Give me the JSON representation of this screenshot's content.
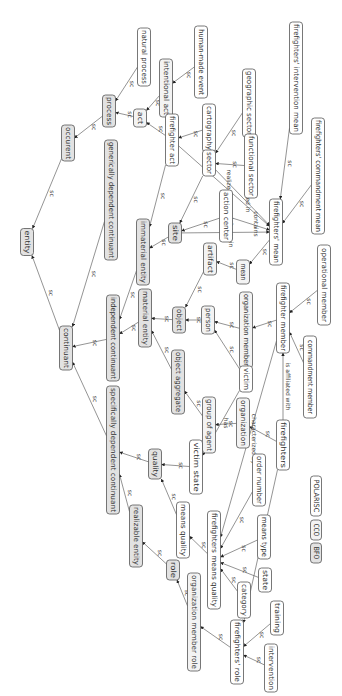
{
  "diagram": {
    "legend": [
      {
        "id": "BFO",
        "label": "BFO",
        "kind": "bfo",
        "cx": 316,
        "cy": 553,
        "w": 11,
        "h": 20
      },
      {
        "id": "CCO",
        "label": "CCO",
        "kind": "cco",
        "cx": 316,
        "cy": 530,
        "w": 11,
        "h": 20
      },
      {
        "id": "POLARISC",
        "label": "POLARISC",
        "kind": "pol",
        "cx": 316,
        "cy": 496,
        "w": 11,
        "h": 40
      }
    ],
    "nodes": [
      {
        "id": "entity",
        "label": "entity",
        "kind": "bfo",
        "cx": 27,
        "cy": 242,
        "w": 13,
        "h": 27
      },
      {
        "id": "occurent",
        "label": "occurent",
        "kind": "bfo",
        "cx": 68,
        "cy": 143,
        "w": 13,
        "h": 36
      },
      {
        "id": "process",
        "label": "process",
        "kind": "bfo",
        "cx": 109,
        "cy": 111,
        "w": 13,
        "h": 32
      },
      {
        "id": "natural_process",
        "label": "natural process",
        "kind": "pol",
        "cx": 144,
        "cy": 57,
        "w": 13,
        "h": 58
      },
      {
        "id": "act",
        "label": "act",
        "kind": "cco",
        "cx": 140,
        "cy": 118,
        "w": 13,
        "h": 18
      },
      {
        "id": "intentional_act",
        "label": "intentional act",
        "kind": "cco",
        "cx": 166,
        "cy": 88,
        "w": 13,
        "h": 58
      },
      {
        "id": "human_made_event",
        "label": "human-made event",
        "kind": "pol",
        "cx": 201,
        "cy": 62,
        "w": 13,
        "h": 72
      },
      {
        "id": "firefighter_act",
        "label": "firefighter act",
        "kind": "pol",
        "cx": 172,
        "cy": 140,
        "w": 13,
        "h": 52
      },
      {
        "id": "cartography",
        "label": "cartography",
        "kind": "pol",
        "cx": 209,
        "cy": 128,
        "w": 13,
        "h": 48
      },
      {
        "id": "geographic_sector",
        "label": "geographic sector",
        "kind": "pol",
        "cx": 249,
        "cy": 103,
        "w": 13,
        "h": 68
      },
      {
        "id": "firefighters_intervention_mean",
        "label": "firefighters' intervention mean",
        "kind": "pol",
        "cx": 296,
        "cy": 78,
        "w": 13,
        "h": 112
      },
      {
        "id": "sector",
        "label": "sector",
        "kind": "pol",
        "cx": 209,
        "cy": 163,
        "w": 13,
        "h": 26
      },
      {
        "id": "functional_sector",
        "label": "functional sector",
        "kind": "pol",
        "cx": 251,
        "cy": 166,
        "w": 13,
        "h": 64
      },
      {
        "id": "firefighters_commandment_mean",
        "label": "firefighters' commandment mean",
        "kind": "pol",
        "cx": 318,
        "cy": 176,
        "w": 13,
        "h": 116
      },
      {
        "id": "generically_dependent_continuant",
        "label": "generically dependent continuant",
        "kind": "bfo",
        "cx": 111,
        "cy": 200,
        "w": 13,
        "h": 120
      },
      {
        "id": "immaterial_entity",
        "label": "immaterial entity",
        "kind": "bfo",
        "cx": 143,
        "cy": 252,
        "w": 13,
        "h": 66
      },
      {
        "id": "site",
        "label": "site",
        "kind": "bfo",
        "cx": 175,
        "cy": 233,
        "w": 13,
        "h": 20
      },
      {
        "id": "action_center",
        "label": "action center",
        "kind": "pol",
        "cx": 226,
        "cy": 216,
        "w": 13,
        "h": 52
      },
      {
        "id": "artifact",
        "label": "artifact",
        "kind": "cco",
        "cx": 210,
        "cy": 259,
        "w": 13,
        "h": 32
      },
      {
        "id": "mean",
        "label": "mean",
        "kind": "cco",
        "cx": 243,
        "cy": 272,
        "w": 13,
        "h": 24
      },
      {
        "id": "firefighters_mean",
        "label": "firefighters' mean",
        "kind": "pol",
        "cx": 276,
        "cy": 232,
        "w": 13,
        "h": 66
      },
      {
        "id": "operational_member",
        "label": "operational member",
        "kind": "pol",
        "cx": 324,
        "cy": 285,
        "w": 13,
        "h": 80
      },
      {
        "id": "continuant",
        "label": "continuant",
        "kind": "bfo",
        "cx": 66,
        "cy": 348,
        "w": 13,
        "h": 44
      },
      {
        "id": "independent_continuant",
        "label": "independent continuant",
        "kind": "bfo",
        "cx": 113,
        "cy": 338,
        "w": 13,
        "h": 86
      },
      {
        "id": "material_entity",
        "label": "material entity",
        "kind": "bfo",
        "cx": 145,
        "cy": 318,
        "w": 13,
        "h": 58
      },
      {
        "id": "object",
        "label": "object",
        "kind": "bfo",
        "cx": 179,
        "cy": 320,
        "w": 13,
        "h": 26
      },
      {
        "id": "person",
        "label": "person",
        "kind": "cco",
        "cx": 208,
        "cy": 320,
        "w": 13,
        "h": 28
      },
      {
        "id": "organization_member",
        "label": "organization member",
        "kind": "cco",
        "cx": 246,
        "cy": 330,
        "w": 13,
        "h": 76
      },
      {
        "id": "firefighter_member",
        "label": "firefighter member",
        "kind": "pol",
        "cx": 283,
        "cy": 318,
        "w": 13,
        "h": 70
      },
      {
        "id": "commandment_member",
        "label": "commandment member",
        "kind": "pol",
        "cx": 310,
        "cy": 377,
        "w": 13,
        "h": 82
      },
      {
        "id": "object_aggregate",
        "label": "object aggregate",
        "kind": "bfo",
        "cx": 178,
        "cy": 382,
        "w": 13,
        "h": 64
      },
      {
        "id": "victim",
        "label": "victim",
        "kind": "pol",
        "cx": 246,
        "cy": 379,
        "w": 13,
        "h": 26
      },
      {
        "id": "group_of_agent",
        "label": "group of agent",
        "kind": "cco",
        "cx": 209,
        "cy": 425,
        "w": 13,
        "h": 56
      },
      {
        "id": "organization",
        "label": "organization",
        "kind": "cco",
        "cx": 243,
        "cy": 423,
        "w": 13,
        "h": 50
      },
      {
        "id": "firefighters",
        "label": "firefighters",
        "kind": "pol",
        "cx": 283,
        "cy": 445,
        "w": 13,
        "h": 50
      },
      {
        "id": "specifically_dependent_continuant",
        "label": "specifically dependent continuant",
        "kind": "bfo",
        "cx": 113,
        "cy": 450,
        "w": 13,
        "h": 128
      },
      {
        "id": "quality",
        "label": "quality",
        "kind": "bfo",
        "cx": 155,
        "cy": 464,
        "w": 13,
        "h": 30
      },
      {
        "id": "victim_state",
        "label": "victim state",
        "kind": "pol",
        "cx": 196,
        "cy": 467,
        "w": 13,
        "h": 54
      },
      {
        "id": "order_number",
        "label": "order number",
        "kind": "pol",
        "cx": 259,
        "cy": 480,
        "w": 13,
        "h": 52
      },
      {
        "id": "realizable_entity",
        "label": "realizable entity",
        "kind": "bfo",
        "cx": 136,
        "cy": 536,
        "w": 13,
        "h": 62
      },
      {
        "id": "means_quality",
        "label": "means quality",
        "kind": "pol",
        "cx": 183,
        "cy": 530,
        "w": 13,
        "h": 56
      },
      {
        "id": "firefighters_means_quality",
        "label": "firefighters means quality",
        "kind": "pol",
        "cx": 214,
        "cy": 560,
        "w": 13,
        "h": 98
      },
      {
        "id": "means_type",
        "label": "means type",
        "kind": "pol",
        "cx": 264,
        "cy": 537,
        "w": 13,
        "h": 44
      },
      {
        "id": "state",
        "label": "state",
        "kind": "pol",
        "cx": 265,
        "cy": 580,
        "w": 13,
        "h": 24
      },
      {
        "id": "category",
        "label": "category",
        "kind": "pol",
        "cx": 244,
        "cy": 600,
        "w": 13,
        "h": 36
      },
      {
        "id": "role",
        "label": "role",
        "kind": "bfo",
        "cx": 173,
        "cy": 570,
        "w": 13,
        "h": 20
      },
      {
        "id": "organization_member_role",
        "label": "organization member role",
        "kind": "cco",
        "cx": 194,
        "cy": 622,
        "w": 13,
        "h": 98
      },
      {
        "id": "firefighters_role",
        "label": "firefighters' role",
        "kind": "pol",
        "cx": 237,
        "cy": 652,
        "w": 13,
        "h": 64
      },
      {
        "id": "training",
        "label": "training",
        "kind": "pol",
        "cx": 277,
        "cy": 618,
        "w": 13,
        "h": 34
      },
      {
        "id": "intervention",
        "label": "intervention",
        "kind": "pol",
        "cx": 271,
        "cy": 668,
        "w": 13,
        "h": 48
      }
    ],
    "edges": [
      {
        "from": "occurent",
        "to": "entity",
        "label": "sc"
      },
      {
        "from": "continuant",
        "to": "entity",
        "label": "sc"
      },
      {
        "from": "process",
        "to": "occurent",
        "label": "sc"
      },
      {
        "from": "natural_process",
        "to": "process",
        "label": "sc"
      },
      {
        "from": "act",
        "to": "process",
        "label": "sc"
      },
      {
        "from": "intentional_act",
        "to": "act",
        "label": "sc"
      },
      {
        "from": "human_made_event",
        "to": "intentional_act",
        "label": "sc"
      },
      {
        "from": "firefighter_act",
        "to": "act",
        "label": "sc"
      },
      {
        "from": "cartography",
        "to": "firefighter_act",
        "label": "sc"
      },
      {
        "from": "geographic_sector",
        "to": "sector",
        "label": "sc"
      },
      {
        "from": "functional_sector",
        "to": "sector",
        "label": "sc"
      },
      {
        "from": "sector",
        "to": "site",
        "label": "sc"
      },
      {
        "from": "action_center",
        "to": "site",
        "label": "sc"
      },
      {
        "from": "site",
        "to": "immaterial_entity",
        "label": "sc"
      },
      {
        "from": "firefighter_act",
        "to": "immaterial_entity",
        "label": "sc"
      },
      {
        "from": "immaterial_entity",
        "to": "independent_continuant",
        "label": "sc"
      },
      {
        "from": "generically_dependent_continuant",
        "to": "continuant",
        "label": "sc"
      },
      {
        "from": "independent_continuant",
        "to": "continuant",
        "label": "sc"
      },
      {
        "from": "specifically_dependent_continuant",
        "to": "continuant",
        "label": "sc"
      },
      {
        "from": "material_entity",
        "to": "independent_continuant",
        "label": "sc"
      },
      {
        "from": "object",
        "to": "material_entity",
        "label": "sc"
      },
      {
        "from": "object_aggregate",
        "to": "material_entity",
        "label": "sc"
      },
      {
        "from": "artifact",
        "to": "object",
        "label": "sc"
      },
      {
        "from": "mean",
        "to": "artifact",
        "label": "sc"
      },
      {
        "from": "firefighters_mean",
        "to": "mean",
        "label": "sc"
      },
      {
        "from": "firefighters_intervention_mean",
        "to": "firefighters_mean",
        "label": "sc"
      },
      {
        "from": "firefighters_commandment_mean",
        "to": "firefighters_mean",
        "label": "sc"
      },
      {
        "from": "person",
        "to": "object",
        "label": "sc"
      },
      {
        "from": "organization_member",
        "to": "person",
        "label": "sc"
      },
      {
        "from": "firefighter_member",
        "to": "organization_member",
        "label": "sc"
      },
      {
        "from": "operational_member",
        "to": "firefighter_member",
        "label": "sc"
      },
      {
        "from": "commandment_member",
        "to": "firefighter_member",
        "label": "sc"
      },
      {
        "from": "victim",
        "to": "person",
        "label": "sc"
      },
      {
        "from": "group_of_agent",
        "to": "object_aggregate",
        "label": "sc"
      },
      {
        "from": "organization",
        "to": "group_of_agent",
        "label": "sc"
      },
      {
        "from": "firefighters",
        "to": "organization",
        "label": "sc"
      },
      {
        "from": "firefighters",
        "to": "firefighter_member",
        "label": "is affiliated with"
      },
      {
        "from": "victim",
        "to": "victim_state",
        "label": "has"
      },
      {
        "from": "firefighter_member",
        "to": "firefighters_means_quality",
        "label": "characterized by"
      },
      {
        "from": "firefighters",
        "to": "firefighters_role",
        "label": "have"
      },
      {
        "from": "sector",
        "to": "firefighters_mean",
        "label": "located in"
      },
      {
        "from": "action_center",
        "to": "firefighters_mean",
        "label": "contains"
      },
      {
        "from": "site",
        "to": "firefighters_mean",
        "label": "inheres in"
      },
      {
        "from": "firefighter_act",
        "to": "firefighters_mean",
        "label": "realized by"
      },
      {
        "from": "quality",
        "to": "specifically_dependent_continuant",
        "label": "sc"
      },
      {
        "from": "victim_state",
        "to": "quality",
        "label": "sc"
      },
      {
        "from": "means_quality",
        "to": "quality",
        "label": "sc"
      },
      {
        "from": "firefighters_means_quality",
        "to": "means_quality",
        "label": "sc"
      },
      {
        "from": "order_number",
        "to": "firefighters_means_quality",
        "label": "sc"
      },
      {
        "from": "means_type",
        "to": "firefighters_means_quality",
        "label": "sc"
      },
      {
        "from": "state",
        "to": "firefighters_means_quality",
        "label": "sc"
      },
      {
        "from": "category",
        "to": "firefighters_means_quality",
        "label": "sc"
      },
      {
        "from": "realizable_entity",
        "to": "specifically_dependent_continuant",
        "label": "sc"
      },
      {
        "from": "role",
        "to": "realizable_entity",
        "label": "sc"
      },
      {
        "from": "organization_member_role",
        "to": "role",
        "label": "sc"
      },
      {
        "from": "firefighters_role",
        "to": "organization_member_role",
        "label": "sc"
      },
      {
        "from": "training",
        "to": "firefighters_role",
        "label": "sc"
      },
      {
        "from": "intervention",
        "to": "firefighters_role",
        "label": "sc"
      }
    ]
  }
}
